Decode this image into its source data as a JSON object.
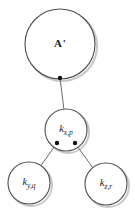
{
  "diagram": {
    "type": "tree",
    "background_color": "#ffffff",
    "stroke_color": "#4d4d4d",
    "shadow_color": "#c8c8c8",
    "dot_color": "#111111",
    "nodes": [
      {
        "id": "root",
        "label_main": "A",
        "label_prime": "'",
        "label_full": "A'",
        "style": "upright-bold",
        "cx": 60,
        "cy": 44,
        "r": 35
      },
      {
        "id": "kxp",
        "label_main": "k",
        "label_sub": "x,p",
        "label_full": "k x,p",
        "style": "italic",
        "cx": 66,
        "cy": 130,
        "r": 21
      },
      {
        "id": "kyq",
        "label_main": "k",
        "label_sub": "y,q",
        "label_full": "k y,q",
        "style": "italic",
        "cx": 29,
        "cy": 183,
        "r": 21
      },
      {
        "id": "kzr",
        "label_main": "k",
        "label_sub": "z,r",
        "label_full": "k z,r",
        "style": "italic",
        "cx": 106,
        "cy": 184,
        "r": 21
      }
    ],
    "connection_dots": [
      {
        "id": "dot-root-bottom",
        "cx": 60,
        "cy": 78,
        "r": 2.2
      },
      {
        "id": "dot-kxp-left",
        "cx": 57,
        "cy": 143,
        "r": 2.2
      },
      {
        "id": "dot-kxp-right",
        "cx": 75,
        "cy": 143,
        "r": 2.2
      }
    ],
    "edges": [
      {
        "id": "edge-root-kxp",
        "from": "root",
        "to": "kxp",
        "x1": 60,
        "y1": 78,
        "x2": 64,
        "y2": 110
      },
      {
        "id": "edge-kxp-kyq",
        "from": "kxp",
        "to": "kyq",
        "x1": 57,
        "y1": 143,
        "x2": 40,
        "y2": 167
      },
      {
        "id": "edge-kxp-kzr",
        "from": "kxp",
        "to": "kzr",
        "x1": 75,
        "y1": 143,
        "x2": 93,
        "y2": 168
      }
    ]
  }
}
